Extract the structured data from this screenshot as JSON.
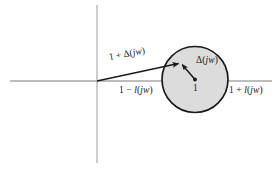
{
  "figure": {
    "background_color": "#ffffff"
  },
  "axes": {
    "real_axis": {
      "name": "real-axis",
      "color": "#9a9a9a",
      "x_start": 10,
      "x_end": 272,
      "y": 81
    },
    "imag_axis": {
      "name": "imaginary-axis",
      "color": "#b3b3b3",
      "x": 97,
      "y_start": 5,
      "y_end": 163
    }
  },
  "disc": {
    "name": "uncertainty-disc",
    "center_x": 195,
    "center_y": 79.5,
    "radius": 33,
    "fill_color": "#dcdcdc",
    "stroke_color": "#1a1a1a",
    "stroke_width": 1.6,
    "center_point_label": "1",
    "center_dot_color": "#1a1a1a"
  },
  "vectors": [
    {
      "name": "vector-one-plus-delta",
      "label": "1 + Δ(jw)",
      "from_x": 97,
      "from_y": 81,
      "to_x": 181,
      "to_y": 63,
      "color": "#1a1a1a"
    },
    {
      "name": "vector-delta",
      "label": "Δ(jw)",
      "from_x": 195,
      "from_y": 79.5,
      "to_x": 181,
      "to_y": 63,
      "color": "#1a1a1a"
    }
  ],
  "labels": {
    "one_plus_delta": {
      "prefix": "1 + Δ(",
      "italic": "jw",
      "suffix": ")",
      "full": "1 + Δ(jw)"
    },
    "delta": {
      "prefix": "Δ(",
      "italic": "jw",
      "suffix": ")",
      "full": "Δ(jw)"
    },
    "one_minus_ell": {
      "prefix": "1 − ",
      "italic_fn": "l",
      "open": "(",
      "italic_arg": "jw",
      "close": ")",
      "full": "1 − l(jw)"
    },
    "one_plus_ell": {
      "prefix": "1 + ",
      "italic_fn": "l",
      "open": "(",
      "italic_arg": "jw",
      "close": ")",
      "full": "1 + l(jw)"
    },
    "center_one": "1"
  }
}
